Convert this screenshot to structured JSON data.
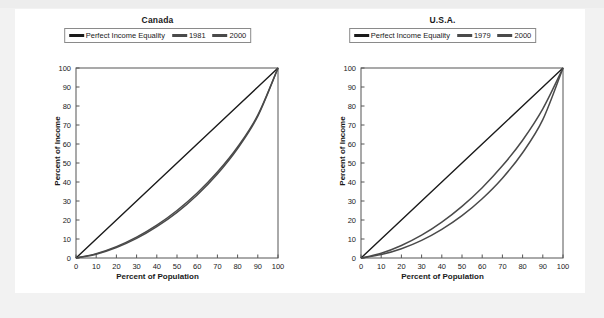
{
  "page": {
    "background_color": "#f1f1f1",
    "card_color": "#ffffff"
  },
  "colors": {
    "equality_line": "#1a1a1a",
    "lorenz_line": "#4a4a4a",
    "axis": "#555555",
    "text": "#1a1a1a"
  },
  "axis_titles": {
    "x": "Percent of Population",
    "y": "Percent of Income"
  },
  "tick_labels": {
    "x": [
      "0",
      "10",
      "20",
      "30",
      "40",
      "50",
      "60",
      "70",
      "80",
      "90",
      "100"
    ],
    "y": [
      "0",
      "10",
      "20",
      "30",
      "40",
      "50",
      "60",
      "70",
      "80",
      "90",
      "100"
    ]
  },
  "chart_data": [
    {
      "type": "line",
      "title": "Canada",
      "xlabel": "Percent of Population",
      "ylabel": "Percent of Income",
      "xlim": [
        0,
        100
      ],
      "ylim": [
        0,
        100
      ],
      "xticks": [
        0,
        10,
        20,
        30,
        40,
        50,
        60,
        70,
        80,
        90,
        100
      ],
      "yticks": [
        0,
        10,
        20,
        30,
        40,
        50,
        60,
        70,
        80,
        90,
        100
      ],
      "grid": false,
      "legend_position": "top-center",
      "x": [
        0,
        10,
        20,
        30,
        40,
        50,
        60,
        70,
        80,
        90,
        100
      ],
      "series": [
        {
          "name": "Perfect Income Equality",
          "color": "#1a1a1a",
          "values": [
            0,
            10,
            20,
            30,
            40,
            50,
            60,
            70,
            80,
            90,
            100
          ]
        },
        {
          "name": "1981",
          "color": "#4a4a4a",
          "values": [
            0,
            2.3,
            6.0,
            11.0,
            17.3,
            25.0,
            34.2,
            45.2,
            58.4,
            75.2,
            100
          ]
        },
        {
          "name": "2000",
          "color": "#4a4a4a",
          "values": [
            0,
            2.0,
            5.5,
            10.3,
            16.5,
            24.0,
            33.2,
            44.2,
            57.6,
            74.6,
            100
          ]
        }
      ]
    },
    {
      "type": "line",
      "title": "U.S.A.",
      "xlabel": "Percent of Population",
      "ylabel": "Percent of Income",
      "xlim": [
        0,
        100
      ],
      "ylim": [
        0,
        100
      ],
      "xticks": [
        0,
        10,
        20,
        30,
        40,
        50,
        60,
        70,
        80,
        90,
        100
      ],
      "yticks": [
        0,
        10,
        20,
        30,
        40,
        50,
        60,
        70,
        80,
        90,
        100
      ],
      "grid": false,
      "legend_position": "top-center",
      "x": [
        0,
        10,
        20,
        30,
        40,
        50,
        60,
        70,
        80,
        90,
        100
      ],
      "series": [
        {
          "name": "Perfect Income Equality",
          "color": "#1a1a1a",
          "values": [
            0,
            10,
            20,
            30,
            40,
            50,
            60,
            70,
            80,
            90,
            100
          ]
        },
        {
          "name": "1979",
          "color": "#4a4a4a",
          "values": [
            0,
            2.5,
            6.6,
            12.0,
            18.9,
            27.2,
            37.0,
            48.5,
            62.0,
            78.5,
            100
          ]
        },
        {
          "name": "2000",
          "color": "#4a4a4a",
          "values": [
            0,
            1.8,
            4.9,
            9.3,
            15.1,
            22.3,
            31.2,
            42.0,
            55.4,
            72.8,
            100
          ]
        }
      ]
    }
  ],
  "panels": [
    {
      "title": "Canada",
      "legend": [
        {
          "label": "Perfect Income Equality",
          "style": "black"
        },
        {
          "label": "1981",
          "style": "gray"
        },
        {
          "label": "2000",
          "style": "gray"
        }
      ]
    },
    {
      "title": "U.S.A.",
      "legend": [
        {
          "label": "Perfect Income Equality",
          "style": "black"
        },
        {
          "label": "1979",
          "style": "gray"
        },
        {
          "label": "2000",
          "style": "gray"
        }
      ]
    }
  ]
}
